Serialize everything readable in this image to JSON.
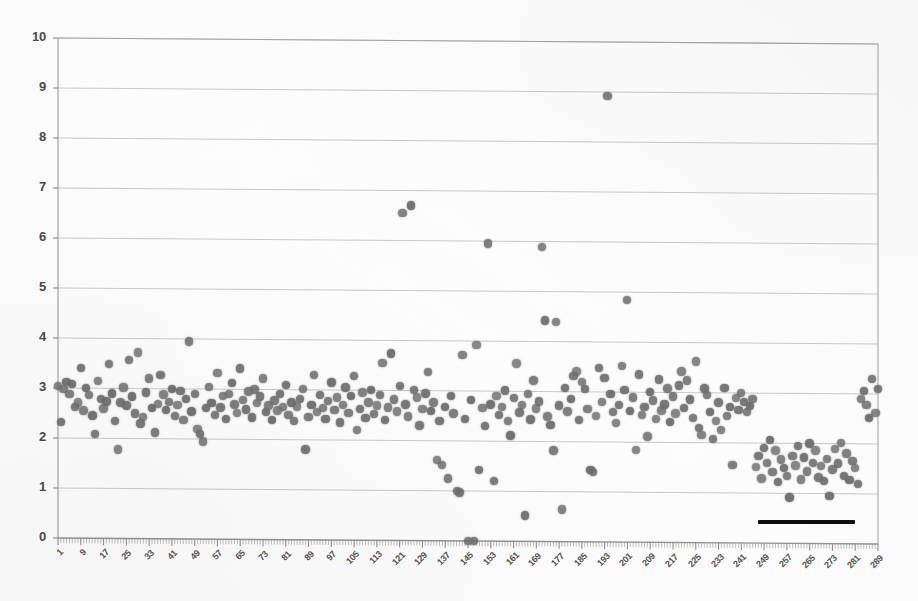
{
  "chart_data": {
    "type": "scatter",
    "title": "",
    "subtitle": "",
    "xlabel": "",
    "ylabel": "",
    "xlim": [
      1,
      289
    ],
    "ylim": [
      0,
      10
    ],
    "grid": true,
    "legend": null,
    "marker_color": "#6e6e6e",
    "gridline_color": "#c8c8c8",
    "axis_color": "#9a9a9a",
    "background_color": "#fefefe",
    "y_ticks": [
      0,
      1,
      2,
      3,
      4,
      5,
      6,
      7,
      8,
      9,
      10
    ],
    "x_ticks": [
      1,
      9,
      17,
      25,
      33,
      41,
      49,
      57,
      65,
      73,
      81,
      89,
      97,
      105,
      113,
      121,
      129,
      137,
      145,
      153,
      161,
      169,
      177,
      185,
      193,
      201,
      209,
      217,
      225,
      233,
      241,
      249,
      257,
      265,
      273,
      281,
      289
    ],
    "x_tick_rotation": -45,
    "n_points": 289,
    "annotations": [
      {
        "name": "horizontal-black-bar",
        "type": "line",
        "color": "#0d0d0d",
        "x_start": 247,
        "x_end": 281,
        "y": 0.42,
        "thickness_px": 4
      }
    ],
    "x": [
      1,
      2,
      3,
      4,
      5,
      6,
      7,
      8,
      9,
      10,
      11,
      12,
      13,
      14,
      15,
      16,
      17,
      18,
      19,
      20,
      21,
      22,
      23,
      24,
      25,
      26,
      27,
      28,
      29,
      30,
      31,
      32,
      33,
      34,
      35,
      36,
      37,
      38,
      39,
      40,
      41,
      42,
      43,
      44,
      45,
      46,
      47,
      48,
      49,
      50,
      51,
      52,
      53,
      54,
      55,
      56,
      57,
      58,
      59,
      60,
      61,
      62,
      63,
      64,
      65,
      66,
      67,
      68,
      69,
      70,
      71,
      72,
      73,
      74,
      75,
      76,
      77,
      78,
      79,
      80,
      81,
      82,
      83,
      84,
      85,
      86,
      87,
      88,
      89,
      90,
      91,
      92,
      93,
      94,
      95,
      96,
      97,
      98,
      99,
      100,
      101,
      102,
      103,
      104,
      105,
      106,
      107,
      108,
      109,
      110,
      111,
      112,
      113,
      114,
      115,
      116,
      117,
      118,
      119,
      120,
      121,
      122,
      123,
      124,
      125,
      126,
      127,
      128,
      129,
      130,
      131,
      132,
      133,
      134,
      135,
      136,
      137,
      138,
      139,
      140,
      141,
      142,
      143,
      144,
      145,
      146,
      147,
      148,
      149,
      150,
      151,
      152,
      153,
      154,
      155,
      156,
      157,
      158,
      159,
      160,
      161,
      162,
      163,
      164,
      165,
      166,
      167,
      168,
      169,
      170,
      171,
      172,
      173,
      174,
      175,
      176,
      177,
      178,
      179,
      180,
      181,
      182,
      183,
      184,
      185,
      186,
      187,
      188,
      189,
      190,
      191,
      192,
      193,
      194,
      195,
      196,
      197,
      198,
      199,
      200,
      201,
      202,
      203,
      204,
      205,
      206,
      207,
      208,
      209,
      210,
      211,
      212,
      213,
      214,
      215,
      216,
      217,
      218,
      219,
      220,
      221,
      222,
      223,
      224,
      225,
      226,
      227,
      228,
      229,
      230,
      231,
      232,
      233,
      234,
      235,
      236,
      237,
      238,
      239,
      240,
      241,
      242,
      243,
      244,
      245,
      246,
      247,
      248,
      249,
      250,
      251,
      252,
      253,
      254,
      255,
      256,
      257,
      258,
      259,
      260,
      261,
      262,
      263,
      264,
      265,
      266,
      267,
      268,
      269,
      270,
      271,
      272,
      273,
      274,
      275,
      276,
      277,
      278,
      279,
      280,
      281,
      282,
      283,
      284,
      285,
      286,
      287,
      288,
      289
    ],
    "y": [
      3.05,
      2.32,
      2.98,
      3.12,
      2.88,
      3.08,
      2.62,
      2.72,
      3.4,
      2.55,
      3.0,
      2.86,
      2.45,
      2.08,
      3.15,
      2.78,
      2.6,
      2.74,
      3.48,
      2.9,
      2.35,
      1.78,
      2.72,
      3.02,
      2.66,
      3.58,
      2.84,
      2.5,
      3.72,
      2.3,
      2.44,
      2.92,
      3.2,
      2.62,
      2.12,
      2.7,
      3.28,
      2.88,
      2.58,
      2.74,
      3.0,
      2.46,
      2.68,
      2.96,
      2.38,
      2.8,
      3.95,
      2.55,
      2.9,
      2.2,
      2.1,
      1.95,
      2.62,
      3.05,
      2.72,
      2.48,
      3.32,
      2.64,
      2.86,
      2.4,
      2.9,
      3.12,
      2.7,
      2.52,
      3.42,
      2.78,
      2.6,
      2.96,
      2.44,
      3.0,
      2.72,
      2.86,
      3.22,
      2.55,
      2.68,
      2.4,
      2.78,
      2.58,
      2.92,
      2.65,
      3.1,
      2.5,
      2.74,
      2.38,
      2.66,
      2.82,
      3.02,
      1.8,
      2.46,
      2.7,
      3.3,
      2.56,
      2.9,
      2.64,
      2.42,
      2.78,
      3.15,
      2.6,
      2.85,
      2.35,
      2.7,
      3.05,
      2.54,
      2.88,
      3.28,
      2.2,
      2.62,
      2.96,
      2.44,
      2.76,
      3.0,
      2.52,
      2.7,
      2.9,
      3.55,
      2.4,
      2.66,
      3.74,
      2.82,
      2.58,
      3.1,
      6.55,
      2.72,
      2.48,
      6.7,
      3.02,
      2.86,
      2.3,
      2.64,
      2.94,
      3.38,
      2.6,
      2.76,
      1.62,
      2.4,
      1.52,
      2.68,
      1.25,
      2.9,
      2.55,
      1.0,
      0.97,
      3.72,
      2.44,
      0.0,
      2.82,
      0.0,
      3.92,
      1.42,
      2.66,
      2.3,
      5.95,
      2.74,
      1.2,
      2.9,
      2.52,
      2.68,
      3.02,
      2.4,
      2.12,
      2.86,
      3.56,
      2.58,
      2.72,
      0.52,
      2.94,
      2.44,
      3.22,
      2.66,
      2.8,
      5.9,
      4.42,
      2.5,
      2.34,
      1.82,
      4.4,
      2.72,
      0.65,
      3.08,
      2.6,
      2.86,
      3.32,
      3.4,
      2.44,
      3.2,
      3.05,
      2.66,
      1.44,
      1.4,
      2.52,
      3.48,
      2.8,
      3.28,
      8.92,
      2.96,
      2.6,
      2.38,
      2.74,
      3.52,
      3.04,
      4.85,
      2.62,
      2.9,
      1.84,
      3.36,
      2.55,
      2.7,
      2.12,
      3.0,
      2.84,
      2.46,
      3.26,
      2.64,
      2.76,
      3.08,
      2.4,
      2.92,
      2.58,
      3.14,
      3.42,
      2.7,
      3.24,
      2.86,
      2.5,
      3.62,
      2.3,
      2.16,
      3.08,
      2.96,
      2.62,
      2.08,
      2.44,
      2.8,
      2.26,
      3.1,
      2.54,
      2.72,
      1.56,
      2.9,
      2.66,
      3.0,
      2.82,
      2.62,
      2.74,
      2.88,
      1.52,
      1.74,
      1.3,
      1.9,
      1.6,
      2.06,
      1.42,
      1.85,
      1.22,
      1.68,
      1.5,
      1.35,
      0.92,
      1.75,
      1.56,
      1.95,
      1.28,
      1.72,
      1.44,
      2.0,
      1.62,
      1.86,
      1.32,
      1.55,
      1.25,
      1.7,
      0.95,
      1.48,
      1.9,
      1.6,
      2.02,
      1.36,
      1.8,
      1.28,
      1.66,
      1.52,
      1.2,
      2.9,
      3.06,
      2.78,
      2.52,
      3.3,
      2.62,
      3.1,
      2.4,
      2.88,
      2.66
    ]
  }
}
